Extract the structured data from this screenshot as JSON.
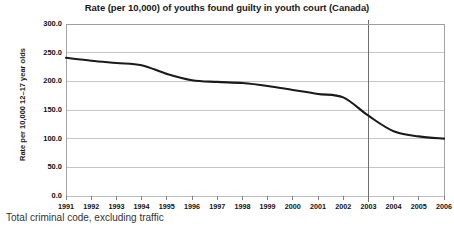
{
  "chart_data": {
    "type": "line",
    "title": "Rate (per 10,000) of youths found guilty in youth court (Canada)",
    "subtitle": "",
    "xlabel": "",
    "ylabel": "Rate per 10,000 12–17 year olds",
    "x": [
      1991,
      1992,
      1993,
      1994,
      1995,
      1996,
      1997,
      1998,
      1999,
      2000,
      2001,
      2002,
      2003,
      2004,
      2005,
      2006
    ],
    "categories": [
      "1991",
      "1992",
      "1993",
      "1994",
      "1995",
      "1996",
      "1997",
      "1998",
      "1999",
      "2000",
      "2001",
      "2002",
      "2003",
      "2004",
      "2005",
      "2006"
    ],
    "values": [
      241,
      236,
      232,
      228,
      213,
      202,
      199,
      197,
      192,
      185,
      178,
      172,
      140,
      113,
      104,
      100
    ],
    "series": [
      {
        "name": "Total criminal code, excluding traffic",
        "values": [
          241,
          236,
          232,
          228,
          213,
          202,
          199,
          197,
          192,
          185,
          178,
          172,
          140,
          113,
          104,
          100
        ]
      }
    ],
    "ylim": [
      0,
      300
    ],
    "ytick_values": [
      0,
      50,
      100,
      150,
      200,
      250,
      300
    ],
    "ytick_labels": [
      "0.0",
      "50.0",
      "100.0",
      "150.0",
      "200.0",
      "250.0",
      "300.0"
    ],
    "xlim": [
      1991,
      2006
    ],
    "grid": "horizontal",
    "legend": "none",
    "line_color": "#1a1a1a",
    "gridline_color": "#b8b8b8",
    "annotations": [
      {
        "type": "vertical-line",
        "x": 2003,
        "label": "2003",
        "color": "#6e6e6e"
      }
    ]
  },
  "footnote": {
    "text": "Total criminal code, excluding traffic"
  }
}
